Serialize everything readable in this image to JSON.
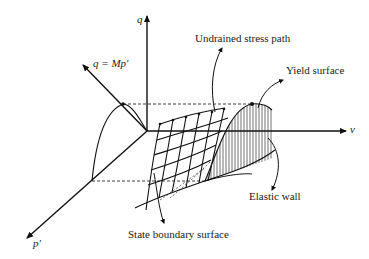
{
  "figure": {
    "type": "3D critical state diagram",
    "axes": {
      "q": "q",
      "v": "v",
      "p": "p′",
      "csl": "q = Mp′"
    },
    "annotations": {
      "undrained_stress_path": "Undrained stress path",
      "yield_surface": "Yield surface",
      "elastic_wall": "Elastic wall",
      "state_boundary_surface": "State boundary surface"
    },
    "colors": {
      "line": "#111111",
      "background": "#ffffff"
    }
  }
}
